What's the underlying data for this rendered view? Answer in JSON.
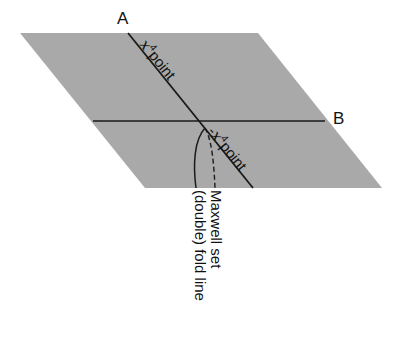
{
  "diagram": {
    "colors": {
      "plane": "#a9a9a9",
      "line": "#1a1a1a",
      "background": "#ffffff"
    },
    "labels": {
      "point_a": "A",
      "point_b": "B",
      "upper_line_symbol": "x",
      "upper_line_exponent": "4",
      "upper_line_text": "point",
      "lower_line_symbol": "-x",
      "lower_line_exponent": "4",
      "lower_line_text": "point",
      "maxwell": "Maxwell set",
      "fold": "(double) fold line"
    }
  }
}
